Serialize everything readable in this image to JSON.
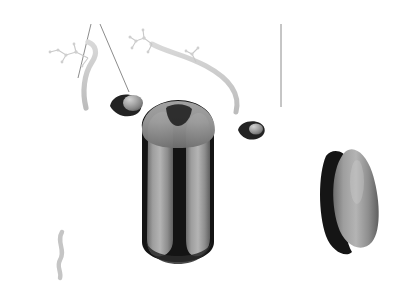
{
  "figure": {
    "background_color": "#ffffff",
    "type": "scientific-illustration",
    "labels": [
      {
        "id": "proteins",
        "text": "proteins",
        "x": 71,
        "y": 9,
        "leader_lines": [
          {
            "x1": 91,
            "y1": 24,
            "x2": 78,
            "y2": 76
          },
          {
            "x1": 100,
            "y1": 24,
            "x2": 128,
            "y2": 90
          }
        ]
      },
      {
        "id": "lipids",
        "text": "lipids",
        "x": 266,
        "y": 9,
        "leader_lines": [
          {
            "x1": 281,
            "y1": 24,
            "x2": 281,
            "y2": 106
          }
        ]
      }
    ],
    "colors": {
      "background": "#ffffff",
      "label_text": "#2b2b2b",
      "leader_line": "#8c8c8c",
      "lipid_head_light": "#d8d8d8",
      "lipid_head_mid": "#a9a9a9",
      "lipid_head_dark": "#7b7b7b",
      "lipid_tail": "#2a2a2a",
      "protein_body": "#8e8e8e",
      "protein_shadow": "#1a1a1a",
      "glyco_chain": "#c6c6c6",
      "top_surface": "#bdbdbd",
      "side_surface": "#9a9a9a"
    },
    "structures": {
      "bilayer": {
        "name": "phospholipid-bilayer",
        "leaflets": 2,
        "head_group_shape": "sphere",
        "tail_shape": "wavy-hydrocarbon-chain",
        "top_surface_rows": 9,
        "top_surface_columns": 30
      },
      "proteins": [
        {
          "name": "central-channel-protein",
          "kind": "transmembrane-channel",
          "x": 178,
          "y": 185
        },
        {
          "name": "right-integral-protein",
          "kind": "transmembrane-globular",
          "x": 352,
          "y": 195
        },
        {
          "name": "top-left-surface-protein",
          "kind": "peripheral-bump",
          "x": 124,
          "y": 104
        },
        {
          "name": "top-right-surface-protein",
          "kind": "peripheral-bump",
          "x": 250,
          "y": 131
        },
        {
          "name": "left-glycoprotein",
          "kind": "glycoprotein-with-sugar-chain",
          "x": 90,
          "y": 60
        },
        {
          "name": "center-glycoprotein",
          "kind": "glycoprotein-with-sugar-chain",
          "x": 185,
          "y": 50
        },
        {
          "name": "bottom-protein-tail",
          "kind": "anchored-tail",
          "x": 62,
          "y": 250
        }
      ]
    }
  }
}
